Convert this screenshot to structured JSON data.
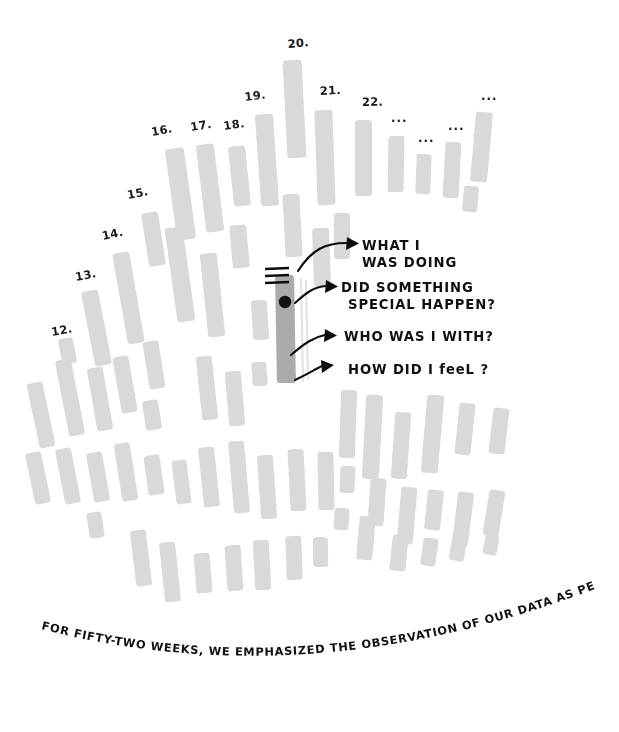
{
  "figure": {
    "title_caption": "FOR FIFTY-TWO WEEKS, WE EMPHASIZED THE OBSERVATION OF OUR DATA AS PERSONAL STORIES.",
    "background_color": "#ffffff",
    "bar_color": "#d8dad8",
    "highlight_bar_color": "#a9acaa",
    "ink_color": "#111111"
  },
  "annotations": [
    {
      "id": "what-i-was-doing",
      "line1": "WHAT I",
      "line2": "WAS DOING"
    },
    {
      "id": "did-something-special-happen",
      "line1": "DID SOMETHING",
      "line2": "SPECIAL HAPPEN?"
    },
    {
      "id": "who-was-i-with",
      "line1": "WHO WAS I WITH?",
      "line2": ""
    },
    {
      "id": "how-did-i-feel",
      "line1": "HOW DID I feeL ?",
      "line2": ""
    }
  ],
  "week_labels": [
    {
      "text": "12.",
      "x": 52,
      "y": 336,
      "rot": -10
    },
    {
      "text": "13.",
      "x": 76,
      "y": 281,
      "rot": -11
    },
    {
      "text": "14.",
      "x": 103,
      "y": 240,
      "rot": -12
    },
    {
      "text": "15.",
      "x": 128,
      "y": 199,
      "rot": -11
    },
    {
      "text": "16.",
      "x": 152,
      "y": 136,
      "rot": -10
    },
    {
      "text": "17.",
      "x": 191,
      "y": 131,
      "rot": -9
    },
    {
      "text": "18.",
      "x": 224,
      "y": 130,
      "rot": -8
    },
    {
      "text": "19.",
      "x": 245,
      "y": 101,
      "rot": -7
    },
    {
      "text": "20.",
      "x": 288,
      "y": 48,
      "rot": -5
    },
    {
      "text": "21.",
      "x": 320,
      "y": 95,
      "rot": -3
    },
    {
      "text": "22.",
      "x": 362,
      "y": 106,
      "rot": -1
    }
  ],
  "ellipsis_labels": [
    {
      "text": "...",
      "x": 391,
      "y": 122
    },
    {
      "text": "...",
      "x": 418,
      "y": 142
    },
    {
      "text": "...",
      "x": 448,
      "y": 130
    },
    {
      "text": "...",
      "x": 481,
      "y": 100
    }
  ],
  "chart_data": {
    "type": "bar",
    "title": "FOR FIFTY-TWO WEEKS, WE EMPHASIZED THE OBSERVATION OF OUR DATA AS PERSONAL STORIES.",
    "xlabel": "",
    "ylabel": "",
    "grid": false,
    "legend": "none",
    "layout": "radial-spiral field of vertical bars, hand-drawn",
    "categories": [
      "12",
      "13",
      "14",
      "15",
      "16",
      "17",
      "18",
      "19",
      "20",
      "21",
      "22",
      "...",
      "...",
      "...",
      "..."
    ],
    "highlight_index": 30,
    "bars": [
      {
        "x": 33,
        "y": 382,
        "w": 16,
        "h": 66,
        "rot": -12
      },
      {
        "x": 62,
        "y": 359,
        "w": 16,
        "h": 77,
        "rot": -11
      },
      {
        "x": 92,
        "y": 367,
        "w": 16,
        "h": 64,
        "rot": -10
      },
      {
        "x": 60,
        "y": 338,
        "w": 15,
        "h": 26,
        "rot": -11
      },
      {
        "x": 88,
        "y": 290,
        "w": 17,
        "h": 76,
        "rot": -11
      },
      {
        "x": 120,
        "y": 252,
        "w": 17,
        "h": 92,
        "rot": -10
      },
      {
        "x": 117,
        "y": 356,
        "w": 16,
        "h": 57,
        "rot": -10
      },
      {
        "x": 145,
        "y": 212,
        "w": 17,
        "h": 54,
        "rot": -9
      },
      {
        "x": 171,
        "y": 227,
        "w": 18,
        "h": 95,
        "rot": -8
      },
      {
        "x": 146,
        "y": 341,
        "w": 16,
        "h": 48,
        "rot": -9
      },
      {
        "x": 171,
        "y": 148,
        "w": 19,
        "h": 92,
        "rot": -8
      },
      {
        "x": 201,
        "y": 144,
        "w": 18,
        "h": 88,
        "rot": -7
      },
      {
        "x": 231,
        "y": 146,
        "w": 17,
        "h": 60,
        "rot": -6
      },
      {
        "x": 204,
        "y": 253,
        "w": 17,
        "h": 84,
        "rot": -6
      },
      {
        "x": 231,
        "y": 225,
        "w": 17,
        "h": 43,
        "rot": -5
      },
      {
        "x": 199,
        "y": 356,
        "w": 16,
        "h": 64,
        "rot": -6
      },
      {
        "x": 227,
        "y": 371,
        "w": 16,
        "h": 55,
        "rot": -5
      },
      {
        "x": 258,
        "y": 114,
        "w": 18,
        "h": 92,
        "rot": -4
      },
      {
        "x": 285,
        "y": 60,
        "w": 19,
        "h": 98,
        "rot": -3
      },
      {
        "x": 284,
        "y": 194,
        "w": 17,
        "h": 63,
        "rot": -3
      },
      {
        "x": 316,
        "y": 110,
        "w": 18,
        "h": 95,
        "rot": -2
      },
      {
        "x": 313,
        "y": 228,
        "w": 17,
        "h": 58,
        "rot": -2
      },
      {
        "x": 355,
        "y": 120,
        "w": 17,
        "h": 76,
        "rot": 0
      },
      {
        "x": 388,
        "y": 136,
        "w": 16,
        "h": 56,
        "rot": 1
      },
      {
        "x": 416,
        "y": 154,
        "w": 15,
        "h": 40,
        "rot": 2
      },
      {
        "x": 444,
        "y": 142,
        "w": 16,
        "h": 56,
        "rot": 3
      },
      {
        "x": 473,
        "y": 112,
        "w": 17,
        "h": 70,
        "rot": 5
      },
      {
        "x": 463,
        "y": 186,
        "w": 15,
        "h": 26,
        "rot": 5
      },
      {
        "x": 334,
        "y": 213,
        "w": 16,
        "h": 46,
        "rot": 0
      },
      {
        "x": 252,
        "y": 300,
        "w": 16,
        "h": 40,
        "rot": -4
      },
      {
        "x": 276,
        "y": 275,
        "w": 19,
        "h": 108,
        "rot": -1,
        "highlight": true
      },
      {
        "x": 340,
        "y": 390,
        "w": 16,
        "h": 68,
        "rot": 2
      },
      {
        "x": 364,
        "y": 395,
        "w": 17,
        "h": 84,
        "rot": 3
      },
      {
        "x": 393,
        "y": 412,
        "w": 16,
        "h": 67,
        "rot": 4
      },
      {
        "x": 424,
        "y": 395,
        "w": 17,
        "h": 78,
        "rot": 5
      },
      {
        "x": 457,
        "y": 403,
        "w": 16,
        "h": 52,
        "rot": 6
      },
      {
        "x": 491,
        "y": 408,
        "w": 16,
        "h": 46,
        "rot": 7
      },
      {
        "x": 340,
        "y": 466,
        "w": 15,
        "h": 27,
        "rot": 3
      },
      {
        "x": 369,
        "y": 478,
        "w": 16,
        "h": 48,
        "rot": 4
      },
      {
        "x": 399,
        "y": 487,
        "w": 16,
        "h": 57,
        "rot": 5
      },
      {
        "x": 426,
        "y": 490,
        "w": 16,
        "h": 40,
        "rot": 6
      },
      {
        "x": 455,
        "y": 492,
        "w": 16,
        "h": 54,
        "rot": 7
      },
      {
        "x": 486,
        "y": 490,
        "w": 16,
        "h": 46,
        "rot": 9
      },
      {
        "x": 334,
        "y": 508,
        "w": 15,
        "h": 22,
        "rot": 4
      },
      {
        "x": 358,
        "y": 516,
        "w": 16,
        "h": 44,
        "rot": 5
      },
      {
        "x": 391,
        "y": 535,
        "w": 16,
        "h": 36,
        "rot": 6
      },
      {
        "x": 422,
        "y": 538,
        "w": 15,
        "h": 28,
        "rot": 8
      },
      {
        "x": 451,
        "y": 531,
        "w": 15,
        "h": 30,
        "rot": 10
      },
      {
        "x": 484,
        "y": 535,
        "w": 14,
        "h": 20,
        "rot": 12
      },
      {
        "x": 30,
        "y": 452,
        "w": 16,
        "h": 52,
        "rot": -12
      },
      {
        "x": 60,
        "y": 448,
        "w": 16,
        "h": 56,
        "rot": -11
      },
      {
        "x": 90,
        "y": 452,
        "w": 16,
        "h": 50,
        "rot": -10
      },
      {
        "x": 118,
        "y": 443,
        "w": 16,
        "h": 58,
        "rot": -9
      },
      {
        "x": 146,
        "y": 455,
        "w": 16,
        "h": 40,
        "rot": -8
      },
      {
        "x": 174,
        "y": 460,
        "w": 15,
        "h": 44,
        "rot": -7
      },
      {
        "x": 201,
        "y": 447,
        "w": 16,
        "h": 60,
        "rot": -6
      },
      {
        "x": 231,
        "y": 441,
        "w": 16,
        "h": 72,
        "rot": -5
      },
      {
        "x": 259,
        "y": 455,
        "w": 16,
        "h": 64,
        "rot": -4
      },
      {
        "x": 289,
        "y": 449,
        "w": 16,
        "h": 62,
        "rot": -3
      },
      {
        "x": 318,
        "y": 452,
        "w": 16,
        "h": 58,
        "rot": -1
      },
      {
        "x": 88,
        "y": 512,
        "w": 15,
        "h": 26,
        "rot": -9
      },
      {
        "x": 133,
        "y": 530,
        "w": 16,
        "h": 56,
        "rot": -7
      },
      {
        "x": 162,
        "y": 542,
        "w": 16,
        "h": 60,
        "rot": -6
      },
      {
        "x": 195,
        "y": 553,
        "w": 16,
        "h": 40,
        "rot": -5
      },
      {
        "x": 226,
        "y": 545,
        "w": 16,
        "h": 46,
        "rot": -4
      },
      {
        "x": 254,
        "y": 540,
        "w": 16,
        "h": 50,
        "rot": -3
      },
      {
        "x": 286,
        "y": 536,
        "w": 16,
        "h": 44,
        "rot": -2
      },
      {
        "x": 313,
        "y": 537,
        "w": 15,
        "h": 30,
        "rot": -1
      },
      {
        "x": 252,
        "y": 362,
        "w": 15,
        "h": 24,
        "rot": -4
      },
      {
        "x": 144,
        "y": 400,
        "w": 16,
        "h": 30,
        "rot": -9
      }
    ]
  }
}
